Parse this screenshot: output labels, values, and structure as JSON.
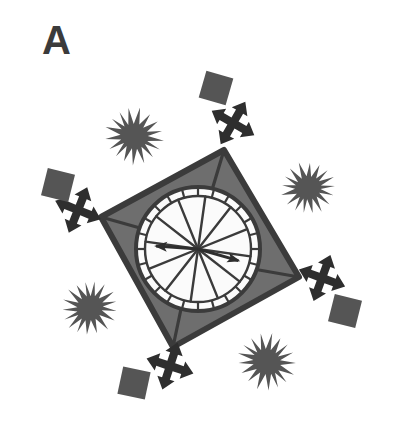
{
  "figure": {
    "panel_label": "A",
    "caption_visible": false,
    "background_color": "#ffffff",
    "width": 401,
    "height": 440,
    "type": "schematic-diagram"
  },
  "colors": {
    "outline": "#3b3b3b",
    "quad_fill": "#6e6e6e",
    "square_fill": "#555555",
    "star_fill": "#555555",
    "circle_fill": "#fbfbfb",
    "ring_stroke": "#3b3b3b",
    "spoke_stroke": "#3b3b3b",
    "arrow_fill": "#2e2e2e",
    "label_color": "#3b3b3b",
    "background": "#ffffff"
  },
  "elements": {
    "panel_label": {
      "name": "panel-label-A",
      "text": "A",
      "x": 42,
      "y": 20,
      "font_size": 40,
      "font_weight": "bold"
    },
    "quadrilateral": {
      "name": "capsid-quadrilateral",
      "vertices": [
        {
          "x": 224,
          "y": 150,
          "label": "top"
        },
        {
          "x": 299,
          "y": 277,
          "label": "right"
        },
        {
          "x": 173,
          "y": 347,
          "label": "bottom"
        },
        {
          "x": 101,
          "y": 217,
          "label": "left"
        }
      ],
      "fill": "#6e6e6e",
      "stroke": "#3b3b3b",
      "stroke_width": 5
    },
    "inner_circle": {
      "name": "central-circle",
      "center": {
        "x": 198,
        "y": 249
      },
      "outer_ring_radius": 62,
      "inner_ring_radius": 54,
      "tick_count": 24,
      "fill": "#fbfbfb",
      "stroke": "#3b3b3b"
    },
    "spokes": {
      "name": "radial-spokes",
      "count": 12,
      "length": 54,
      "stroke_width": 2.2,
      "angles_deg": [
        8,
        38,
        68,
        98,
        128,
        158,
        188,
        218,
        248,
        278,
        308,
        338
      ]
    },
    "vertex_connectors": {
      "name": "vertex-connector-lines",
      "count": 4,
      "note": "short lines joining each quadrilateral vertex inward to the circle rim"
    },
    "center_arrows": [
      {
        "name": "center-arrow-left",
        "angle_deg": 188,
        "length": 44,
        "direction": "left"
      },
      {
        "name": "center-arrow-right",
        "angle_deg": 18,
        "length": 44,
        "direction": "right"
      }
    ],
    "starbursts": [
      {
        "name": "starburst-top-left",
        "cx": 134,
        "cy": 136,
        "radius": 27,
        "spikes": 22
      },
      {
        "name": "starburst-top-right",
        "cx": 308,
        "cy": 188,
        "radius": 25,
        "spikes": 22
      },
      {
        "name": "starburst-bottom-left",
        "cx": 90,
        "cy": 308,
        "radius": 26,
        "spikes": 22
      },
      {
        "name": "starburst-bottom-right",
        "cx": 267,
        "cy": 362,
        "radius": 27,
        "spikes": 22
      }
    ],
    "cross_arrows": [
      {
        "name": "cross-arrow-top",
        "cx": 233,
        "cy": 123,
        "rotation_deg": 25,
        "scale": 1.0
      },
      {
        "name": "cross-arrow-left",
        "cx": 76,
        "cy": 211,
        "rotation_deg": 20,
        "scale": 1.0
      },
      {
        "name": "cross-arrow-right",
        "cx": 325,
        "cy": 278,
        "rotation_deg": 20,
        "scale": 1.0
      },
      {
        "name": "cross-arrow-bottom",
        "cx": 169,
        "cy": 368,
        "rotation_deg": 18,
        "scale": 1.0
      }
    ],
    "squares": [
      {
        "name": "square-top",
        "cx": 216,
        "cy": 88,
        "size": 26,
        "rotation_deg": 15
      },
      {
        "name": "square-left",
        "cx": 57,
        "cy": 185,
        "size": 26,
        "rotation_deg": 14
      },
      {
        "name": "square-right",
        "cx": 345,
        "cy": 312,
        "size": 26,
        "rotation_deg": 14
      },
      {
        "name": "square-bottom",
        "cx": 134,
        "cy": 384,
        "size": 26,
        "rotation_deg": 12
      }
    ]
  }
}
